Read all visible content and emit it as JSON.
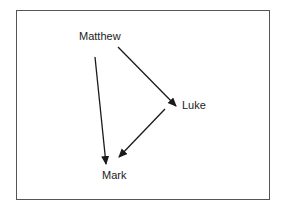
{
  "diagram": {
    "type": "directed-graph",
    "nodes": [
      {
        "id": "matthew",
        "label": "Matthew"
      },
      {
        "id": "luke",
        "label": "Luke"
      },
      {
        "id": "mark",
        "label": "Mark"
      }
    ],
    "edges": [
      {
        "from": "matthew",
        "to": "luke"
      },
      {
        "from": "matthew",
        "to": "mark"
      },
      {
        "from": "luke",
        "to": "mark"
      }
    ]
  },
  "colors": {
    "line": "#1a1a1a",
    "border": "#555555",
    "text": "#222222"
  }
}
